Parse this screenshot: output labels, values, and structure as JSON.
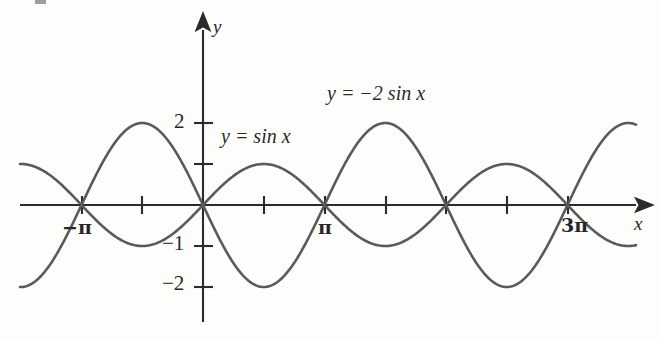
{
  "figure": {
    "background_color": "#fdfdfb",
    "curve_color": "#5a5a5a",
    "axis_color": "#2b2b2b",
    "text_color": "#262626"
  },
  "axes": {
    "x_axis_label": "x",
    "y_axis_label": "y",
    "x_tick_labels": [
      {
        "text": "−π",
        "value": -3.14159,
        "px": 78,
        "py": 230
      },
      {
        "text": "π",
        "value": 3.14159,
        "px": 323,
        "py": 230
      },
      {
        "text": "3π",
        "value": 9.42478,
        "px": 566,
        "py": 228
      }
    ],
    "y_tick_labels": [
      {
        "text": "2",
        "value": 2,
        "px": 181,
        "py": 126
      },
      {
        "text": "−1",
        "value": -1,
        "px": 176,
        "py": 246
      },
      {
        "text": "−2",
        "value": -2,
        "px": 176,
        "py": 286
      }
    ],
    "x_label_pos": {
      "px": 634,
      "py": 222
    },
    "y_label_pos": {
      "px": 213,
      "py": 23
    }
  },
  "annotations": [
    {
      "id": "sin-label",
      "text": "y = sin x",
      "lhs": "y",
      "op": "=",
      "rhs": "sin x",
      "px": 221,
      "py": 136
    },
    {
      "id": "neg2sin-label",
      "text": "y = −2 sin x",
      "lhs": "y",
      "op": "= −2",
      "rhs": "sin x",
      "px": 327,
      "py": 93
    }
  ],
  "chart_data": {
    "type": "line",
    "title": "",
    "subtitle": "",
    "xlabel": "x",
    "ylabel": "y",
    "grid": false,
    "legend": "inline-annotations",
    "xlim": [
      -4.712,
      11.0
    ],
    "ylim": [
      -2.9,
      2.9
    ],
    "x_axis_ticks_values": [
      -3.14159,
      -1.5708,
      0,
      1.5708,
      3.14159,
      4.71239,
      6.28319,
      7.85398,
      9.42478
    ],
    "x_axis_labeled_ticks": [
      "−π",
      "π",
      "3π"
    ],
    "y_axis_ticks_values": [
      2,
      1,
      -1,
      -2
    ],
    "y_axis_labeled_ticks": [
      "2",
      "−1",
      "−2"
    ],
    "series": [
      {
        "name": "y = sin x",
        "formula": "sin(x)",
        "amplitude": 1,
        "color": "#5a5a5a",
        "x": [
          -3.14159,
          -2.35619,
          -1.5708,
          -0.7854,
          0,
          0.7854,
          1.5708,
          2.35619,
          3.14159,
          3.92699,
          4.71239,
          5.49779,
          6.28319,
          7.06858,
          7.85398,
          8.63938,
          9.42478
        ],
        "values": [
          0,
          -0.7071,
          -1,
          -0.7071,
          0,
          0.7071,
          1,
          0.7071,
          0,
          -0.7071,
          -1,
          -0.7071,
          0,
          0.7071,
          1,
          0.7071,
          0
        ]
      },
      {
        "name": "y = −2 sin x",
        "formula": "-2*sin(x)",
        "amplitude": 2,
        "color": "#5a5a5a",
        "x": [
          -3.14159,
          -2.35619,
          -1.5708,
          -0.7854,
          0,
          0.7854,
          1.5708,
          2.35619,
          3.14159,
          3.92699,
          4.71239,
          5.49779,
          6.28319,
          7.06858,
          7.85398,
          8.63938,
          9.42478
        ],
        "values": [
          0,
          1.4142,
          2,
          1.4142,
          0,
          -1.4142,
          -2,
          -1.4142,
          0,
          1.4142,
          2,
          1.4142,
          0,
          -1.4142,
          -2,
          -1.4142,
          0
        ]
      }
    ],
    "annotations": [
      "y = sin x",
      "y = −2 sin x"
    ]
  }
}
